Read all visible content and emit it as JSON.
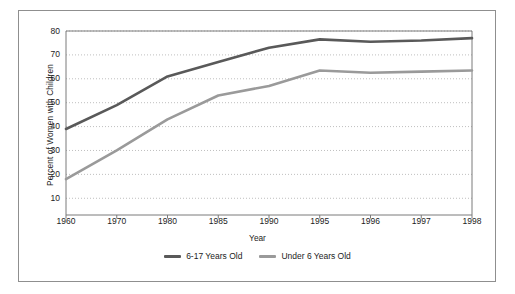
{
  "chart_data": {
    "type": "line",
    "title": "",
    "xlabel": "Year",
    "ylabel": "Percent of Women with Children",
    "categories": [
      "1960",
      "1970",
      "1980",
      "1985",
      "1990",
      "1995",
      "1996",
      "1997",
      "1998"
    ],
    "series": [
      {
        "name": "6-17 Years Old",
        "color": "#595959",
        "values": [
          39,
          49,
          61,
          67,
          73,
          76.5,
          75.5,
          76,
          77
        ]
      },
      {
        "name": "Under 6 Years Old",
        "color": "#9a9a9a",
        "values": [
          18,
          30,
          43,
          53,
          57,
          63.5,
          62.5,
          63,
          63.5
        ]
      }
    ],
    "ylim": [
      3,
      80
    ],
    "yticks": [
      10,
      20,
      30,
      40,
      50,
      60,
      70,
      80
    ],
    "ytick_labels": [
      "10",
      "20",
      "30",
      "40",
      "50",
      "60",
      "70",
      "80"
    ],
    "grid": true,
    "grid_style": "dotted-horizontal",
    "legend_position": "bottom-center"
  },
  "axes": {
    "y_title": "Percent of Women with Children",
    "x_title": "Year"
  },
  "legend": {
    "entries": [
      {
        "label": "6-17 Years Old",
        "color": "#595959"
      },
      {
        "label": "Under 6 Years Old",
        "color": "#9a9a9a"
      }
    ]
  },
  "colors": {
    "series_dark": "#595959",
    "series_light": "#9a9a9a",
    "frame": "#8f8f8f",
    "axis": "#7a7a7a",
    "grid": "#b8b8b8",
    "text": "#1c1c1c",
    "background": "#ffffff"
  }
}
